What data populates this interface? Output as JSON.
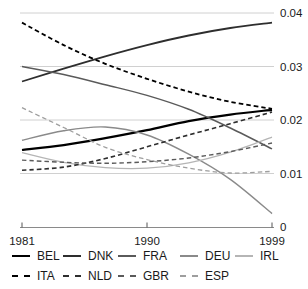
{
  "chart_data": {
    "type": "line",
    "title": "",
    "xlabel": "",
    "ylabel": "",
    "xlim": [
      1981,
      1999
    ],
    "ylim": [
      0,
      0.04
    ],
    "grid": "horizontal",
    "legend_position": "bottom",
    "x": [
      1981,
      1984,
      1987,
      1990,
      1993,
      1996,
      1999
    ],
    "xticks": [
      "1981",
      "1990",
      "1999"
    ],
    "xtick_years": [
      1981,
      1990,
      1999
    ],
    "yticks": [
      0,
      0.01,
      0.02,
      0.03,
      0.04
    ],
    "ytick_labels": [
      "0",
      "0.01",
      "0.02",
      "0.03",
      "0.04"
    ],
    "series": [
      {
        "name": "BEL",
        "style": "solid",
        "color": "#000000",
        "width": 2.2,
        "values": [
          0.0144,
          0.0153,
          0.0166,
          0.0181,
          0.0198,
          0.021,
          0.0219
        ]
      },
      {
        "name": "DNK",
        "style": "solid",
        "color": "#2e2e2e",
        "width": 1.8,
        "values": [
          0.0272,
          0.0296,
          0.0319,
          0.034,
          0.0358,
          0.0372,
          0.0382
        ]
      },
      {
        "name": "FRA",
        "style": "solid",
        "color": "#5a5a5a",
        "width": 1.5,
        "values": [
          0.03,
          0.0285,
          0.0266,
          0.0246,
          0.022,
          0.0185,
          0.0146
        ]
      },
      {
        "name": "DEU",
        "style": "solid",
        "color": "#8a8a8a",
        "width": 1.4,
        "values": [
          0.0162,
          0.018,
          0.0187,
          0.0172,
          0.0136,
          0.0089,
          0.0025
        ]
      },
      {
        "name": "IRL",
        "style": "solid",
        "color": "#b5b5b5",
        "width": 1.3,
        "values": [
          0.0139,
          0.0121,
          0.0111,
          0.011,
          0.012,
          0.014,
          0.0168
        ]
      },
      {
        "name": "ITA",
        "style": "dashed",
        "color": "#000000",
        "width": 1.8,
        "values": [
          0.0382,
          0.034,
          0.0305,
          0.0277,
          0.0253,
          0.0234,
          0.0221
        ]
      },
      {
        "name": "NLD",
        "style": "dashed",
        "color": "#2e2e2e",
        "width": 1.6,
        "values": [
          0.0106,
          0.0112,
          0.0128,
          0.015,
          0.0172,
          0.0193,
          0.0215
        ]
      },
      {
        "name": "GBR",
        "style": "dashed",
        "color": "#5a5a5a",
        "width": 1.4,
        "values": [
          0.0125,
          0.0121,
          0.0119,
          0.0122,
          0.0129,
          0.0141,
          0.0157
        ]
      },
      {
        "name": "ESP",
        "style": "dashed",
        "color": "#9e9e9e",
        "width": 1.3,
        "values": [
          0.0223,
          0.0186,
          0.0149,
          0.0126,
          0.011,
          0.0101,
          0.0104
        ]
      }
    ],
    "legend_rows": [
      [
        "BEL",
        "DNK",
        "FRA",
        "DEU",
        "IRL"
      ],
      [
        "ITA",
        "NLD",
        "GBR",
        "ESP"
      ]
    ]
  },
  "colors": {
    "background": "#ffffff",
    "gridline": "#d0d0d0",
    "axis": "#8a8a8a",
    "tick": "#555555",
    "label": "#1a1a1a"
  }
}
